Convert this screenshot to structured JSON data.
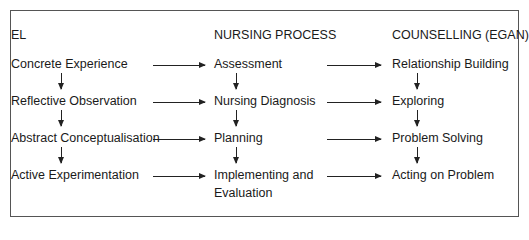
{
  "diagram": {
    "columns": [
      {
        "header": "EL",
        "items": [
          "Concrete Experience",
          "Reflective Observation",
          "Abstract Conceptualisation",
          "Active Experimentation"
        ]
      },
      {
        "header": "NURSING PROCESS",
        "items": [
          "Assessment",
          "Nursing Diagnosis",
          "Planning",
          "Implementing and",
          "Evaluation"
        ]
      },
      {
        "header": "COUNSELLING (EGAN)",
        "items": [
          "Relationship Building",
          "Exploring",
          "Problem Solving",
          "Acting on Problem"
        ]
      }
    ],
    "arrows": {
      "horizontal": "each stage maps left-to-right across columns",
      "vertical": "each column flows top-to-bottom"
    }
  }
}
